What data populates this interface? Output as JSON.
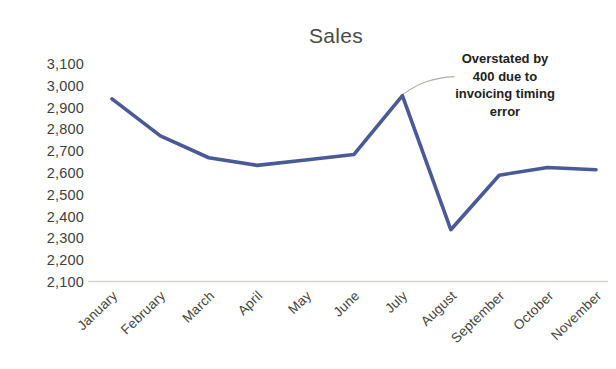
{
  "chart_data": {
    "type": "line",
    "title": "Sales",
    "xlabel": "",
    "ylabel": "",
    "categories": [
      "January",
      "February",
      "March",
      "April",
      "May",
      "June",
      "July",
      "August",
      "September",
      "October",
      "November"
    ],
    "values": [
      2940,
      2770,
      2670,
      2635,
      2660,
      2685,
      2955,
      2340,
      2590,
      2625,
      2615
    ],
    "series": [
      {
        "name": "Sales",
        "values": [
          2940,
          2770,
          2670,
          2635,
          2660,
          2685,
          2955,
          2340,
          2590,
          2625,
          2615
        ]
      }
    ],
    "ylim": [
      2100,
      3100
    ],
    "y_ticks": [
      3100,
      3000,
      2900,
      2800,
      2700,
      2600,
      2500,
      2400,
      2300,
      2200,
      2100
    ],
    "y_tick_labels": [
      "3,100",
      "3,000",
      "2,900",
      "2,800",
      "2,700",
      "2,600",
      "2,500",
      "2,400",
      "2,300",
      "2,200",
      "2,100"
    ],
    "grid": false,
    "legend": false,
    "legend_position": "none",
    "line_color": "#4a5a96",
    "annotations": [
      {
        "text": "Overstated by 400 due to invoicing timing error",
        "lines": [
          "Overstated by",
          "400 due to",
          "invoicing timing",
          "error"
        ],
        "points_to_category": "July",
        "points_to_value": 2955
      }
    ]
  },
  "colors": {
    "line": "#4a5a96",
    "axis": "#d5d5d2",
    "text": "#3f3f3a",
    "title": "#4a4a44",
    "leader": "#b0aea2",
    "background": "#ffffff"
  }
}
